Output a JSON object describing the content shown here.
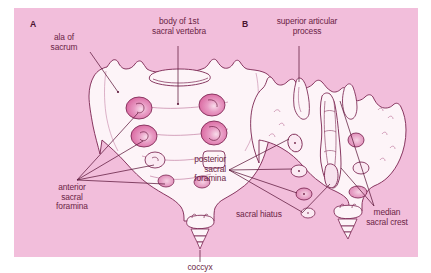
{
  "figure": {
    "background_color": "#ffffff",
    "panel_color": "#f2bedb",
    "bone_fill": "#fdf4f8",
    "outline_color": "#7a2450",
    "foramen_shade": "#e087b4",
    "label_color": "#6b1f46"
  },
  "panels": [
    {
      "id": "A",
      "letter": "A",
      "view": "anterior"
    },
    {
      "id": "B",
      "letter": "B",
      "view": "posterior"
    }
  ],
  "labels": {
    "ala_of_sacrum": "ala of\nsacrum",
    "body_of_1st_sacral_vertebra": "body of 1st\nsacral vertebra",
    "anterior_sacral_foramina": "anterior\nsacral\nforamina",
    "coccyx": "coccyx",
    "superior_articular_process": "superior articular\nprocess",
    "posterior_sacral_foramina": "posterior\nsacral\nforamina",
    "sacral_hiatus": "sacral hiatus",
    "median_sacral_crest": "median\nsacral crest"
  }
}
